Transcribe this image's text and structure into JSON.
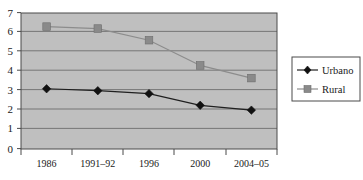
{
  "chart_data": {
    "type": "line",
    "title": "",
    "xlabel": "",
    "ylabel": "",
    "categories": [
      "1986",
      "1991–92",
      "1996",
      "2000",
      "2004–05"
    ],
    "series": [
      {
        "name": "Urbano",
        "values": [
          3.1,
          3.0,
          2.85,
          2.25,
          2.0
        ],
        "color": "#1f1f1f",
        "marker": "diamond"
      },
      {
        "name": "Rural",
        "values": [
          6.3,
          6.2,
          5.6,
          4.3,
          3.65
        ],
        "color": "#8a8a8a",
        "marker": "square"
      }
    ],
    "ylim": [
      0,
      7
    ],
    "yticks": [
      "0",
      "1",
      "2",
      "3",
      "4",
      "5",
      "6",
      "7"
    ],
    "grid": true,
    "legend_position": "right",
    "plot_background": "#bfbfbf"
  },
  "legend": {
    "items": [
      {
        "label": "Urbano",
        "marker": "diamond-marker-icon"
      },
      {
        "label": "Rural",
        "marker": "square-marker-icon"
      }
    ]
  },
  "axes": {
    "y_tick_labels": [
      "7",
      "6",
      "5",
      "4",
      "3",
      "2",
      "1",
      "0"
    ],
    "x_tick_labels": [
      "1986",
      "1991–92",
      "1996",
      "2000",
      "2004–05"
    ]
  }
}
